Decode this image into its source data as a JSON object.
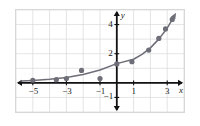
{
  "figure": {
    "background_color": "#ffffff",
    "frame_color": "#d8d8d8"
  },
  "chart_data": {
    "type": "scatter",
    "title": "",
    "subtitle": "",
    "xlabel": "x",
    "ylabel": "y",
    "xlim": [
      -6,
      4
    ],
    "ylim": [
      -2,
      5
    ],
    "grid": true,
    "grid_color": "#d8d8d8",
    "grid_step_x": 1,
    "grid_step_y": 1,
    "legend": null,
    "axis_color": "#111111",
    "point_color": "#6e6e78",
    "curve_color": "#6e6e78",
    "xticks": [
      -5,
      -3,
      -1,
      1,
      3
    ],
    "xtick_labels": [
      "−5",
      "−3",
      "−1",
      "1",
      "3"
    ],
    "yticks": [
      4,
      2,
      -1
    ],
    "ytick_labels": [
      "4",
      "2",
      "−1"
    ],
    "points": [
      {
        "x": -5.0,
        "y": 0.18
      },
      {
        "x": -3.6,
        "y": 0.22
      },
      {
        "x": -3.0,
        "y": 0.3
      },
      {
        "x": -2.1,
        "y": 0.85
      },
      {
        "x": -1.0,
        "y": 0.3
      },
      {
        "x": 0.0,
        "y": 1.3
      },
      {
        "x": 0.9,
        "y": 1.45
      },
      {
        "x": 1.9,
        "y": 2.25
      },
      {
        "x": 2.5,
        "y": 3.05
      },
      {
        "x": 2.9,
        "y": 3.7
      },
      {
        "x": 3.3,
        "y": 4.35
      }
    ],
    "curve": {
      "label": "fitted exponential curve",
      "equation_form": "y = a*b^x",
      "samples": [
        {
          "x": -5.7,
          "y": 0.12
        },
        {
          "x": -5.0,
          "y": 0.16
        },
        {
          "x": -4.0,
          "y": 0.24
        },
        {
          "x": -3.0,
          "y": 0.37
        },
        {
          "x": -2.0,
          "y": 0.57
        },
        {
          "x": -1.0,
          "y": 0.88
        },
        {
          "x": 0.0,
          "y": 1.32
        },
        {
          "x": 1.0,
          "y": 1.62
        },
        {
          "x": 1.5,
          "y": 1.95
        },
        {
          "x": 2.0,
          "y": 2.4
        },
        {
          "x": 2.5,
          "y": 3.0
        },
        {
          "x": 3.0,
          "y": 3.75
        },
        {
          "x": 3.35,
          "y": 4.45
        }
      ],
      "arrow_end": true
    },
    "x_axis_arrows": [
      "left",
      "right"
    ],
    "y_axis_arrows": [
      "up",
      "down"
    ]
  }
}
